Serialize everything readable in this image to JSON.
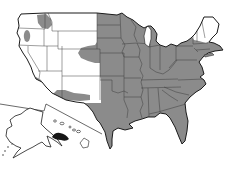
{
  "figure": {
    "description": "Outline map of the United States showing a gray shaded range covering the Great Plains and all states eastward to the Atlantic coast (including all of Texas and Florida), with Maine and northern New England unshaded, plus small isolated gray patches in eastern Washington/northern Idaho, northwestern Oregon, western Arizona, and the central Arizona–New Mexico highlands; Alaska and Hawaii insets at lower left with one Hawaiian island group filled dark.",
    "map_type": "species range outline map",
    "region": "United States",
    "visible_text": []
  },
  "map": {
    "mainland": {
      "shaded_extent": "Dakotas, Nebraska, Kansas, Oklahoma and Texas eastward to the Atlantic coast",
      "unshaded_areas": "Pacific, Great Basin and Rocky Mountain states; Maine and northern New Hampshire/Vermont",
      "westward_bulge": "lobe of shading extending west near the Wyoming-Nebraska-Colorado corner",
      "disjunct_shaded_patches": [
        "eastern Washington and northern Idaho",
        "northwestern Oregon",
        "western Arizona strip",
        "central Arizona into western New Mexico"
      ]
    },
    "insets": {
      "alaska": {
        "shaded": "none"
      },
      "hawaii": {
        "shaded": "one island group filled dark, other islands outlined"
      }
    }
  },
  "colors": {
    "background": "#ffffff",
    "land_fill": "#ffffff",
    "range_fill": "#8b8b8b",
    "state_border": "#3f3f3f",
    "country_outline": "#1b1b1b",
    "inset_divider": "#2a2a2a",
    "hawaii_dark_fill": "#161616"
  }
}
